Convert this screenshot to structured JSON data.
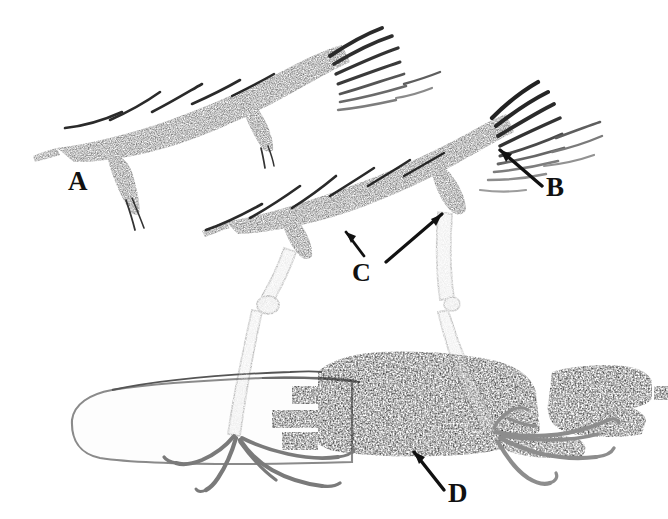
{
  "figure": {
    "caption_present": false,
    "background_color": "#ffffff",
    "ink_color": "#1a1a1a",
    "mid_tone_color": "#6e6e6e",
    "pale_tone_color": "#b8b8b8",
    "width": 668,
    "height": 519,
    "media": "scanned pen-and-ink / halftone line drawing"
  },
  "labels": [
    {
      "id": "A",
      "text": "A",
      "x": 68,
      "y": 168,
      "points_to": "upper dark bristled wing structure (upper left)",
      "has_leader_arrow": false
    },
    {
      "id": "B",
      "text": "B",
      "x": 546,
      "y": 174,
      "points_to": "splayed feather tips at distal end of lower wing structure",
      "has_leader_arrow": true
    },
    {
      "id": "C",
      "text": "C",
      "x": 352,
      "y": 260,
      "points_to": "two joint nodes where legs meet the lower wing structure",
      "has_leader_arrow": true,
      "arrow_count": 2
    },
    {
      "id": "D",
      "text": "D",
      "x": 448,
      "y": 480,
      "points_to": "dark speckled body mass (lower right)",
      "has_leader_arrow": true
    }
  ],
  "structures": [
    {
      "name": "upper-wing",
      "label_ref": "A",
      "description": "elongated dark tapering bar running from lower-left to upper-right with bristle projections along the upper edge and splayed feather tips at the right end"
    },
    {
      "name": "lower-wing",
      "label_ref": "B",
      "description": "second elongated dark tapering bar below and right of the upper wing, with bristle projections and a fan of splayed pale feather tips at the right end"
    },
    {
      "name": "left-leg",
      "description": "slender pale two-segmented leg descending from the lower wing with a knee node, ending in a splayed foot with four toes"
    },
    {
      "name": "right-leg",
      "description": "slender pale two-segmented leg descending from the right end of the lower wing, ending in a splayed foot with four toes"
    },
    {
      "name": "pale-body",
      "description": "pale outlined rounded elongated form occupying the lower left, drawn in thin outline only"
    },
    {
      "name": "dark-body-mass",
      "label_ref": "D",
      "description": "large dark speckled irregular mass in the lower right with a separate smaller dark block at the far right"
    }
  ]
}
